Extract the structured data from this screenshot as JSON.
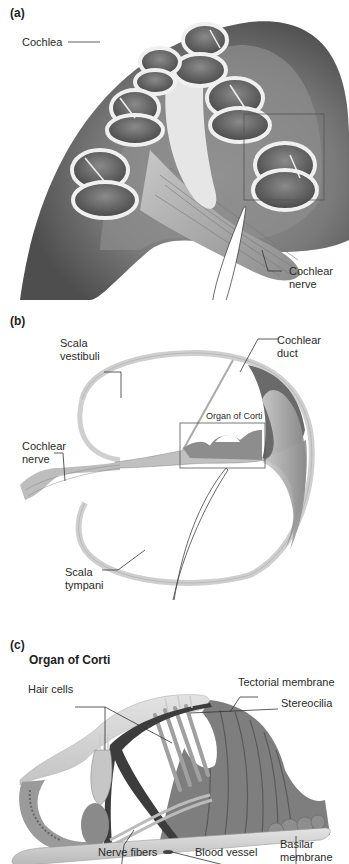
{
  "figure": {
    "panels": [
      {
        "id": "(a)",
        "labels": {
          "cochlea": "Cochlea",
          "cochlear_nerve_line1": "Cochlear",
          "cochlear_nerve_line2": "nerve"
        }
      },
      {
        "id": "(b)",
        "labels": {
          "scala_vestibuli_line1": "Scala",
          "scala_vestibuli_line2": "vestibuli",
          "cochlear_duct_line1": "Cochlear",
          "cochlear_duct_line2": "duct",
          "organ_of_corti": "Organ of Corti",
          "cochlear_nerve_line1": "Cochlear",
          "cochlear_nerve_line2": "nerve",
          "scala_tympani_line1": "Scala",
          "scala_tympani_line2": "tympani"
        }
      },
      {
        "id": "(c)",
        "title": "Organ of Corti",
        "labels": {
          "tectorial_membrane": "Tectorial membrane",
          "hair_cells": "Hair cells",
          "stereocilia": "Stereocilia",
          "nerve_fibers": "Nerve fibers",
          "blood_vessel": "Blood vessel",
          "basilar_membrane_line1": "Basilar",
          "basilar_membrane_line2": "membrane"
        }
      }
    ],
    "colors": {
      "background": "#ffffff",
      "tissue_dark": "#6e6e6e",
      "tissue_mid": "#a8a8a8",
      "tissue_light": "#d8d8d8",
      "leader_line": "#333333"
    }
  }
}
